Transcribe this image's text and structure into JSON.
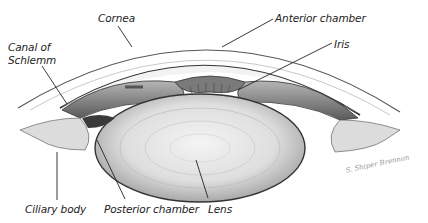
{
  "figure": {
    "labels": {
      "cornea": "Cornea",
      "anterior_chamber": "Anterior chamber",
      "iris": "Iris",
      "canal_of_schlemm_line1": "Canal of",
      "canal_of_schlemm_line2": "Schlemm",
      "ciliary_body": "Ciliary body",
      "posterior_chamber": "Posterior chamber",
      "lens": "Lens"
    },
    "signature": "S. Shiper Brennan",
    "colors": {
      "ink": "#222222",
      "shade_dark": "#4a4a4a",
      "shade_mid": "#8c8c8c",
      "shade_light": "#d6d6d6",
      "background": "#ffffff"
    }
  }
}
